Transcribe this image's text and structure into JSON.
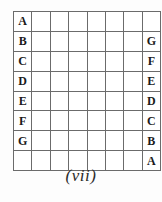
{
  "figure": {
    "caption": "(vii)",
    "grid": {
      "rows": 8,
      "columns": 8,
      "border_color": "#6b6b6b",
      "cell_background": "#ffffff",
      "text_color": "#1a1a1a",
      "cells": [
        [
          "A",
          "",
          "",
          "",
          "",
          "",
          "",
          ""
        ],
        [
          "B",
          "",
          "",
          "",
          "",
          "",
          "",
          "G"
        ],
        [
          "C",
          "",
          "",
          "",
          "",
          "",
          "",
          "F"
        ],
        [
          "D",
          "",
          "",
          "",
          "",
          "",
          "",
          "E"
        ],
        [
          "E",
          "",
          "",
          "",
          "",
          "",
          "",
          "D"
        ],
        [
          "F",
          "",
          "",
          "",
          "",
          "",
          "",
          "C"
        ],
        [
          "G",
          "",
          "",
          "",
          "",
          "",
          "",
          "B"
        ],
        [
          "",
          "",
          "",
          "",
          "",
          "",
          "",
          "A"
        ]
      ]
    }
  }
}
